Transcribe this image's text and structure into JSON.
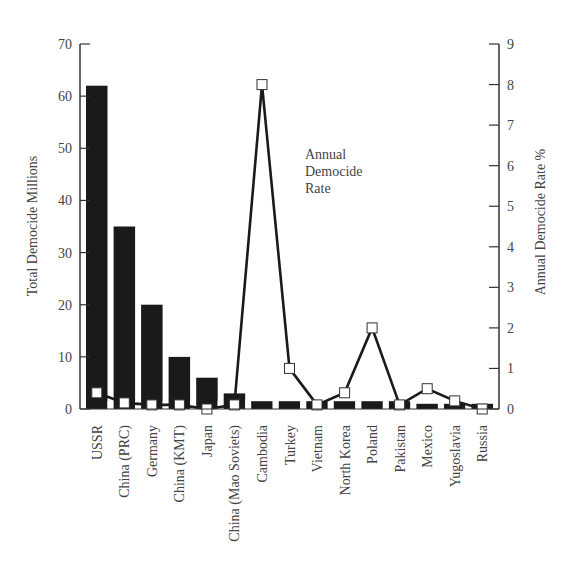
{
  "chart_data": {
    "type": "bar+line",
    "title": "",
    "annotation": [
      "Annual",
      "Democide",
      "Rate"
    ],
    "ylabel_left": "Total Democide Millions",
    "ylabel_right": "Annual Democide Rate %",
    "ylim_left": [
      0,
      70
    ],
    "ylim_right": [
      0,
      9
    ],
    "yticks_left": [
      0,
      10,
      20,
      30,
      40,
      50,
      60,
      70
    ],
    "yticks_right": [
      0,
      1,
      2,
      3,
      4,
      5,
      6,
      7,
      8,
      9
    ],
    "categories": [
      "USSR",
      "China (PRC)",
      "Germany",
      "China (KMT)",
      "Japan",
      "China (Mao Soviets)",
      "Cambodia",
      "Turkey",
      "Vietnam",
      "North Korea",
      "Poland",
      "Pakistan",
      "Mexico",
      "Yugoslavia",
      "Russia"
    ],
    "series": [
      {
        "name": "Total Democide Millions",
        "type": "bar",
        "axis": "left",
        "color": "#1a1a1a",
        "values": [
          62,
          35,
          20,
          10,
          6,
          3,
          1.5,
          1.5,
          1.5,
          1.5,
          1.5,
          1.5,
          1,
          1,
          1
        ]
      },
      {
        "name": "Annual Democide Rate",
        "type": "line",
        "axis": "right",
        "color": "#1a1a1a",
        "marker": "open-square",
        "values": [
          0.4,
          0.15,
          0.1,
          0.1,
          0.0,
          0.1,
          8.0,
          1.0,
          0.1,
          0.4,
          2.0,
          0.1,
          0.5,
          0.2,
          0.0
        ]
      }
    ],
    "grid": false,
    "legend_position": "none"
  }
}
